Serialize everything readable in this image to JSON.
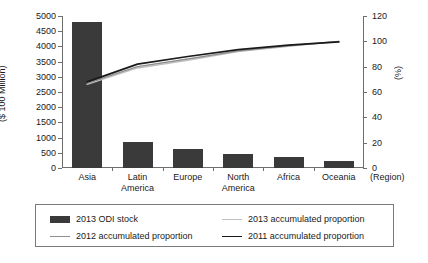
{
  "chart_data": {
    "type": "bar",
    "title": "",
    "categories": [
      "Asia",
      "Latin\nAmerica",
      "Europe",
      "North\nAmerica",
      "Africa",
      "Oceania"
    ],
    "xlabel": "(Region)",
    "ylabel": "($ 100 Million)",
    "y2label": "(%)",
    "ylim": [
      0,
      5000
    ],
    "y2lim": [
      0,
      120
    ],
    "yticks": [
      0,
      500,
      1000,
      1500,
      2000,
      2500,
      3000,
      3500,
      4000,
      4500,
      5000
    ],
    "y2ticks": [
      0,
      20,
      40,
      60,
      80,
      100,
      120
    ],
    "grid": false,
    "legend_position": "below",
    "series": [
      {
        "name": "2013 ODI stock",
        "kind": "bar",
        "axis": "left",
        "color": "#3a3a3a",
        "values": [
          4800,
          855,
          625,
          460,
          360,
          230
        ]
      },
      {
        "name": "2013 accumulated proportion",
        "kind": "line",
        "axis": "right",
        "color": "#c0c0c0",
        "values": [
          66,
          79,
          85,
          92,
          96,
          100
        ]
      },
      {
        "name": "2012 accumulated proportion",
        "kind": "line",
        "axis": "right",
        "color": "#8e8e8e",
        "values": [
          67,
          80,
          86,
          92.5,
          96.5,
          100
        ]
      },
      {
        "name": "2011 accumulated proportion",
        "kind": "line",
        "axis": "right",
        "color": "#1a1a1a",
        "values": [
          68,
          82,
          88,
          93.5,
          97,
          99.5
        ]
      }
    ]
  },
  "legend": {
    "entries": [
      {
        "label": "2013 ODI stock",
        "marker": "bar-swatch",
        "color": "#3a3a3a"
      },
      {
        "label": "2013 accumulated proportion",
        "marker": "line-swatch",
        "color": "#c0c0c0"
      },
      {
        "label": "2012 accumulated proportion",
        "marker": "line-swatch",
        "color": "#8e8e8e"
      },
      {
        "label": "2011 accumulated proportion",
        "marker": "line-swatch",
        "color": "#1a1a1a"
      }
    ]
  }
}
